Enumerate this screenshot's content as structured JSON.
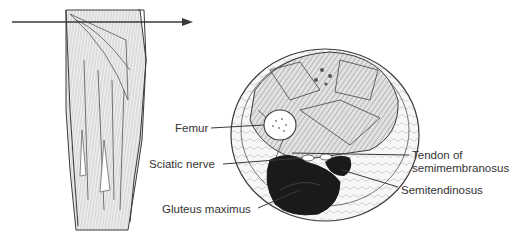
{
  "figure": {
    "section_arrow": {
      "direction": "right",
      "y": 22,
      "x_start": 12,
      "x_end": 193
    },
    "colors": {
      "line": "#3a3a3a",
      "muscle_fill": "#cfcfcf",
      "gluteus_fill": "#1a1a1a",
      "background": "#ffffff",
      "text": "#333333"
    }
  },
  "labels": {
    "femur": "Femur",
    "sciatic_nerve": "Sciatic nerve",
    "gluteus_maximus": "Gluteus maximus",
    "tendon_line1": "Tendon of",
    "tendon_line2": "semimembranosus",
    "semitendinosus": "Semitendinosus"
  }
}
